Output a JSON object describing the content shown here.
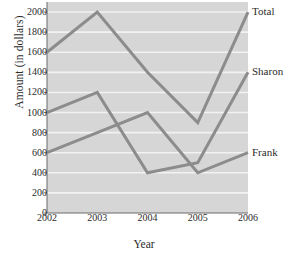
{
  "chart_data": {
    "type": "line",
    "title": "",
    "subtitle": "",
    "xlabel": "Year",
    "ylabel": "Amount (in dollars)",
    "categories": [
      "2002",
      "2003",
      "2004",
      "2005",
      "2006"
    ],
    "x": [
      2002,
      2003,
      2004,
      2005,
      2006
    ],
    "xlim": [
      2002,
      2006
    ],
    "ylim": [
      0,
      2100
    ],
    "yticks": [
      0,
      200,
      400,
      600,
      800,
      1000,
      1200,
      1400,
      1600,
      1800,
      2000
    ],
    "ytick_labels": [
      "0",
      "200",
      "400",
      "600",
      "800",
      "1000",
      "1200",
      "1400",
      "1600",
      "1800",
      "2000"
    ],
    "grid": "horizontal",
    "legend_position": "right-inline-labels",
    "series": [
      {
        "name": "Total",
        "values": [
          1600,
          2000,
          1400,
          900,
          2000
        ],
        "color": "#8c8c8c",
        "label_y": 2000
      },
      {
        "name": "Sharon",
        "values": [
          1000,
          1200,
          400,
          500,
          1400
        ],
        "color": "#8c8c8c",
        "label_y": 1400
      },
      {
        "name": "Frank",
        "values": [
          600,
          800,
          1000,
          400,
          600
        ],
        "color": "#8c8c8c",
        "label_y": 600
      }
    ],
    "plot_background": "#d6d6d6",
    "gridline_color": "#f2f2f2",
    "axis_color": "#6b6b6b",
    "line_width": 3
  }
}
